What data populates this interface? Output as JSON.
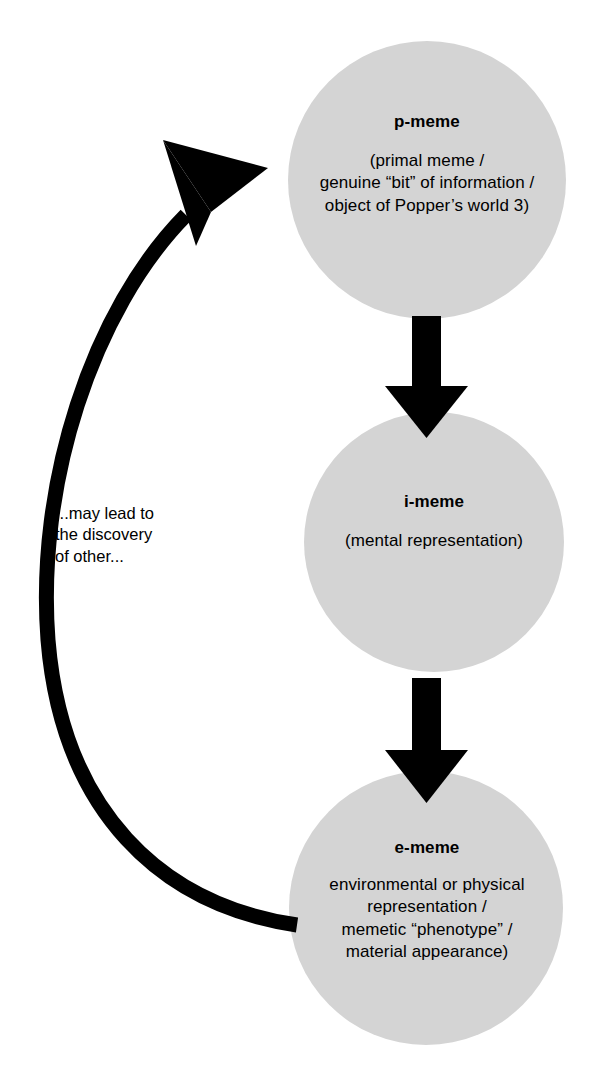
{
  "diagram": {
    "type": "cycle-flow",
    "background_color": "#ffffff",
    "node_fill_color": "#d4d4d4",
    "arrow_color": "#000000",
    "text_color": "#000000",
    "nodes": [
      {
        "id": "p-meme",
        "title": "p-meme",
        "body": "(primal meme /\ngenuine “bit” of information /\nobject of Popper’s world 3)"
      },
      {
        "id": "i-meme",
        "title": "i-meme",
        "body": "(mental representation)"
      },
      {
        "id": "e-meme",
        "title": "e-meme",
        "body": "environmental or physical\nrepresentation /\nmemetic “phenotype” /\nmaterial appearance)"
      }
    ],
    "edges": [
      {
        "id": "p-to-i",
        "from": "p-meme",
        "to": "i-meme",
        "label": ""
      },
      {
        "id": "i-to-e",
        "from": "i-meme",
        "to": "e-meme",
        "label": ""
      },
      {
        "id": "e-to-p",
        "from": "e-meme",
        "to": "p-meme",
        "label": "...may lead to\nthe discovery\nof other..."
      }
    ]
  }
}
